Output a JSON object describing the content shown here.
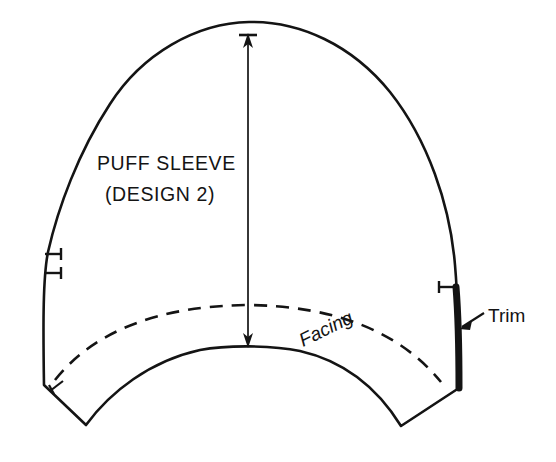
{
  "diagram": {
    "kind": "sewing-pattern-piece",
    "background_color": "#ffffff",
    "ink_color": "#141414",
    "labels": {
      "piece_name": "PUFF SLEEVE",
      "piece_variant": "(DESIGN 2)",
      "facing": "Facing",
      "trim": "Trim"
    },
    "markings": {
      "grainline": {
        "name": "grain-line",
        "style": "double-headed-arrow-vertical",
        "top_point": [
          248,
          36
        ],
        "bottom_point": [
          248,
          346
        ]
      },
      "notches": [
        {
          "name": "double-notch-left",
          "side": "left",
          "count": 2,
          "y_positions": [
            254,
            273
          ]
        },
        {
          "name": "single-notch-right",
          "side": "right",
          "count": 1,
          "y_positions": [
            287
          ]
        },
        {
          "name": "corner-notch-left",
          "side": "left-hem",
          "count": 1,
          "y_positions": [
            387
          ]
        }
      ],
      "facing_line": {
        "name": "facing-stitch-line",
        "style": "dashed"
      },
      "trim_edge": {
        "name": "trim-edge",
        "style": "thickened-stroke",
        "side": "right",
        "from_y": 287,
        "to_y": 388
      }
    },
    "geometry": {
      "apex": [
        249,
        22
      ],
      "left_extreme_x": 44,
      "right_extreme_x": 456,
      "hem_center": [
        248,
        347
      ],
      "left_corner": [
        44,
        385
      ],
      "right_corner": [
        459,
        388
      ],
      "left_hem_tip": [
        86,
        425
      ],
      "right_hem_tip": [
        401,
        426
      ]
    }
  }
}
